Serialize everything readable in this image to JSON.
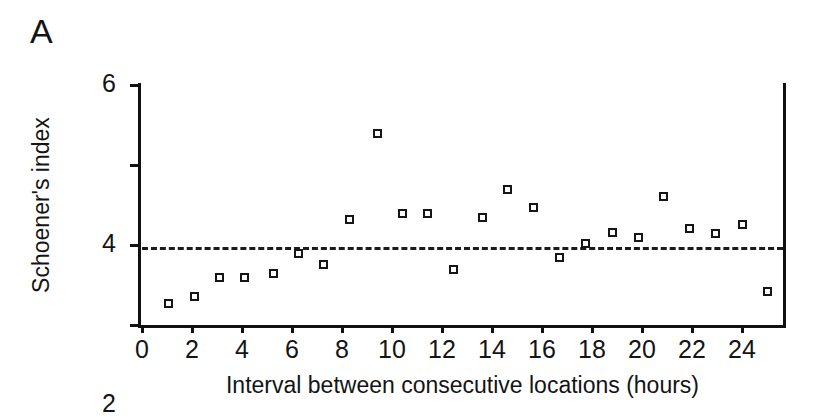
{
  "panel": {
    "label": "A"
  },
  "chart_data": {
    "type": "scatter",
    "title": "",
    "xlabel": "Interval between consecutive locations (hours)",
    "ylabel": "Schoener's index",
    "xlim": [
      0,
      25.64
    ],
    "ylim": [
      0,
      6
    ],
    "xticks": [
      0,
      2,
      4,
      6,
      8,
      10,
      12,
      14,
      16,
      18,
      20,
      22,
      24
    ],
    "yticks": [
      0,
      2,
      4,
      6
    ],
    "xtick_labels": [
      "0",
      "2",
      "4",
      "6",
      "8",
      "10",
      "12",
      "14",
      "16",
      "18",
      "20",
      "22",
      "24"
    ],
    "ytick_labels": [
      "0",
      "2",
      "4",
      "6"
    ],
    "grid": false,
    "legend": null,
    "marker": "open-square",
    "marker_color": "#161616",
    "reference_line": {
      "orientation": "horizontal",
      "value": 1.95,
      "style": "dashed",
      "color": "#1b1b1b"
    },
    "x": [
      1.05,
      2.1,
      3.1,
      4.1,
      5.25,
      6.25,
      7.25,
      8.3,
      9.4,
      10.4,
      11.4,
      12.45,
      13.6,
      14.6,
      15.65,
      16.7,
      17.75,
      18.8,
      19.85,
      20.85,
      21.9,
      22.95,
      24.0,
      25.0
    ],
    "y": [
      0.55,
      0.72,
      1.2,
      1.2,
      1.28,
      1.8,
      1.52,
      2.63,
      4.78,
      2.78,
      2.78,
      1.4,
      2.68,
      3.38,
      2.95,
      1.7,
      2.05,
      2.32,
      2.18,
      3.22,
      2.42,
      2.28,
      2.52,
      0.85
    ],
    "points": [
      {
        "x": 1.05,
        "y": 0.55
      },
      {
        "x": 2.1,
        "y": 0.72
      },
      {
        "x": 3.1,
        "y": 1.2
      },
      {
        "x": 4.1,
        "y": 1.2
      },
      {
        "x": 5.25,
        "y": 1.28
      },
      {
        "x": 6.25,
        "y": 1.8
      },
      {
        "x": 7.25,
        "y": 1.52
      },
      {
        "x": 8.3,
        "y": 2.63
      },
      {
        "x": 9.4,
        "y": 4.78
      },
      {
        "x": 10.4,
        "y": 2.78
      },
      {
        "x": 11.4,
        "y": 2.78
      },
      {
        "x": 12.45,
        "y": 1.4
      },
      {
        "x": 13.6,
        "y": 2.68
      },
      {
        "x": 14.6,
        "y": 3.38
      },
      {
        "x": 15.65,
        "y": 2.95
      },
      {
        "x": 16.7,
        "y": 1.7
      },
      {
        "x": 17.75,
        "y": 2.05
      },
      {
        "x": 18.8,
        "y": 2.32
      },
      {
        "x": 19.85,
        "y": 2.18
      },
      {
        "x": 20.85,
        "y": 3.22
      },
      {
        "x": 21.9,
        "y": 2.42
      },
      {
        "x": 22.95,
        "y": 2.28
      },
      {
        "x": 24.0,
        "y": 2.52
      },
      {
        "x": 25.0,
        "y": 0.85
      }
    ]
  }
}
